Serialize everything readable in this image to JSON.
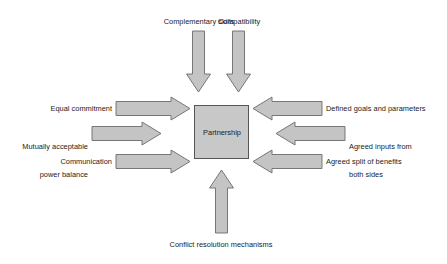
{
  "diagram": {
    "center": {
      "label": "Partnership",
      "fill": "#c8c8c8",
      "stroke": "#555555"
    },
    "style": {
      "arrow_fill": "#c4c4c4",
      "arrow_stroke": "#6b6b6b",
      "background": "#ffffff",
      "text_color": "#1a1a1a"
    },
    "inputs": [
      {
        "id": "complementary-skills",
        "label": "Complementary skills",
        "direction": "down",
        "side": "top"
      },
      {
        "id": "compatibility",
        "label": "Compatibility",
        "direction": "down",
        "side": "top"
      },
      {
        "id": "equal-commitment",
        "label": "Equal commitment",
        "direction": "right",
        "side": "left"
      },
      {
        "id": "mutually-acceptable-power-balance",
        "label": "Mutually acceptable\npower balance",
        "line1": "Mutually acceptable",
        "line2": "power balance",
        "direction": "right",
        "side": "left"
      },
      {
        "id": "communication",
        "label": "Communication",
        "direction": "right",
        "side": "left"
      },
      {
        "id": "defined-goals-and-parameters",
        "label": "Defined goals and parameters",
        "direction": "left",
        "side": "right"
      },
      {
        "id": "agreed-inputs-from-both-sides",
        "label": "Agreed inputs from\nboth sides",
        "line1": "Agreed inputs from",
        "line2": "both sides",
        "direction": "left",
        "side": "right"
      },
      {
        "id": "agreed-split-of-benefits",
        "label": "Agreed split of benefits",
        "direction": "left",
        "side": "right"
      },
      {
        "id": "conflict-resolution-mechanisms",
        "label": "Conflict resolution mechanisms",
        "direction": "up",
        "side": "bottom"
      }
    ]
  }
}
